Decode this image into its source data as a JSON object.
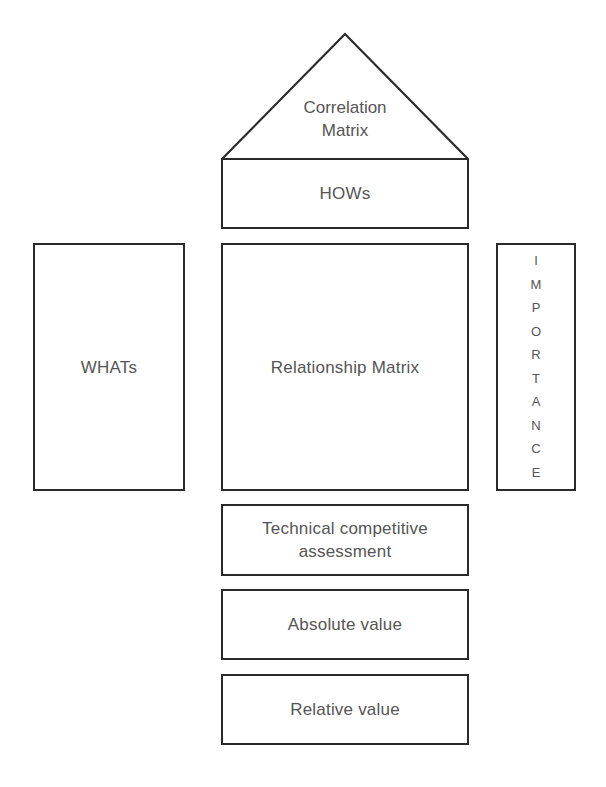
{
  "diagram": {
    "roof": {
      "line1": "Correlation",
      "line2": "Matrix"
    },
    "hows": "HOWs",
    "whats": "WHATs",
    "relationship": "Relationship Matrix",
    "importance": {
      "letters": [
        "I",
        "M",
        "P",
        "O",
        "R",
        "T",
        "A",
        "N",
        "C",
        "E"
      ],
      "word": "IMPORTANCE"
    },
    "technical": {
      "line1": "Technical competitive",
      "line2": "assessment"
    },
    "absolute": "Absolute value",
    "relative": "Relative value",
    "colors": {
      "stroke": "#2a2a2a",
      "text": "#555555",
      "background": "#ffffff"
    }
  }
}
